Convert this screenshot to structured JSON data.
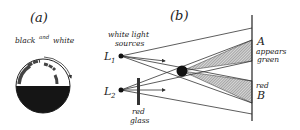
{
  "panel_a": {
    "label": "(a)",
    "caption_black": "black",
    "caption_and": "and",
    "caption_white": "white"
  },
  "panel_b": {
    "label": "(b)",
    "sources_line1": "white light",
    "sources_line2": "sources",
    "L1": "L",
    "L1_sub": "1",
    "L2": "L",
    "L2_sub": "2",
    "glass_line1": "red",
    "glass_line2": "glass",
    "A": "A",
    "appears": "appears",
    "green": "green",
    "red": "red",
    "B": "B"
  },
  "colors": {
    "ink": "#222222",
    "shadow_fill": "#9a9a9a",
    "object": "#111111"
  }
}
